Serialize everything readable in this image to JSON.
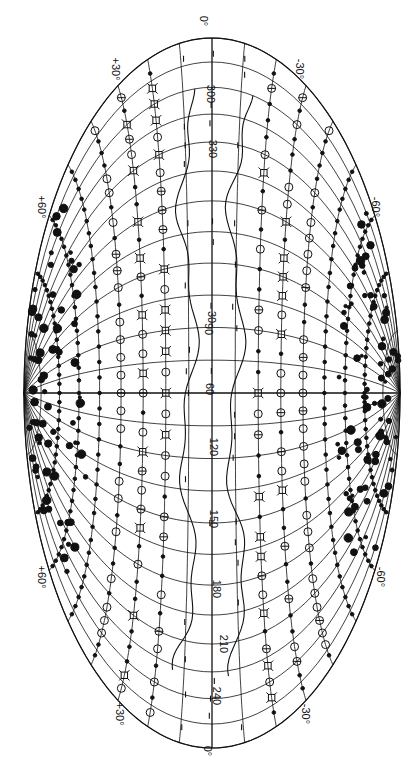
{
  "figure": {
    "colors": {
      "ink": "#111111",
      "paper": "#ffffff"
    }
  },
  "longitude_labels": [
    {
      "text": "0°",
      "x": 211,
      "y": 22
    },
    {
      "text": "300",
      "x": 214,
      "y": 95
    },
    {
      "text": "330",
      "x": 216,
      "y": 150
    },
    {
      "text": "30",
      "x": 218,
      "y": 318
    },
    {
      "text": "60",
      "x": 216,
      "y": 390
    },
    {
      "text": "90",
      "x": 215,
      "y": 330
    },
    {
      "text": "120",
      "x": 217,
      "y": 448
    },
    {
      "text": "150",
      "x": 217,
      "y": 520
    },
    {
      "text": "180",
      "x": 220,
      "y": 590
    },
    {
      "text": "210",
      "x": 227,
      "y": 645
    },
    {
      "text": "240",
      "x": 220,
      "y": 697
    },
    {
      "text": "0°",
      "x": 215,
      "y": 752
    }
  ],
  "latitude_labels": [
    {
      "text": "+30°",
      "x": 116,
      "y": 70
    },
    {
      "text": "-30°",
      "x": 302,
      "y": 70
    },
    {
      "text": "+60°",
      "x": 42,
      "y": 208
    },
    {
      "text": "-60°",
      "x": 378,
      "y": 208
    },
    {
      "text": "+60°",
      "x": 42,
      "y": 578
    },
    {
      "text": "-60°",
      "x": 383,
      "y": 578
    },
    {
      "text": "+30°",
      "x": 120,
      "y": 715
    },
    {
      "text": "-30°",
      "x": 308,
      "y": 715
    }
  ],
  "legend_symbols": [
    {
      "name": "filled-dot",
      "meaning": "small filled circle source"
    },
    {
      "name": "open-circle",
      "meaning": "open circle source"
    },
    {
      "name": "circle-with-bar",
      "meaning": "barred circle source"
    },
    {
      "name": "square-star",
      "meaning": "square with corner ticks source"
    },
    {
      "name": "tick-mark",
      "meaning": "short vertical tick near galactic plane"
    },
    {
      "name": "large-blob",
      "meaning": "dark filled cluster"
    }
  ]
}
